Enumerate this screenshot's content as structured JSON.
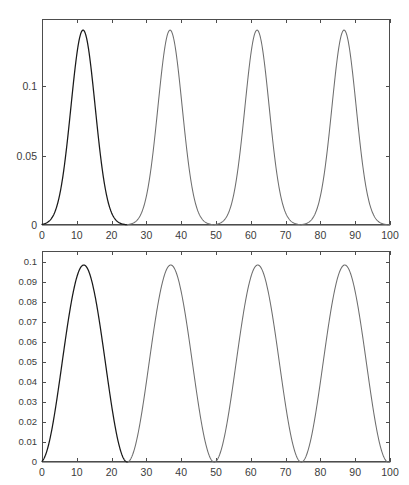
{
  "figure": {
    "background_color": "#ffffff",
    "axis_color": "#4d4d4d",
    "primary_curve_color": "#1a1a1a",
    "secondary_curve_color": "#6e6e6e",
    "panel_count": 2
  },
  "chart_data": [
    {
      "type": "line",
      "panel": "top",
      "title": "",
      "xlabel": "",
      "ylabel": "",
      "xlim": [
        0,
        100
      ],
      "ylim": [
        0,
        0.1485
      ],
      "grid": false,
      "legend": null,
      "xticks": [
        0,
        10,
        20,
        30,
        40,
        50,
        60,
        70,
        80,
        90,
        100
      ],
      "xtick_labels": [
        "0",
        "10",
        "20",
        "30",
        "40",
        "50",
        "60",
        "70",
        "80",
        "90",
        "100"
      ],
      "yticks": [
        0,
        0.05,
        0.1
      ],
      "ytick_labels": [
        "0",
        "0.05",
        "0.1"
      ],
      "description": "Four narrow Gaussian-like pulses of equal height, periodic with period 25, peaks reaching about 0.1405 and decaying to zero between pulses. First pulse drawn in black, remaining three in gray.",
      "series": [
        {
          "name": "pulse-1",
          "style": "primary",
          "peak_x": 11.8,
          "peak_y": 0.1405,
          "half_width": 4.1,
          "x_start": 0,
          "x_end": 24.5
        },
        {
          "name": "pulse-2",
          "style": "secondary",
          "peak_x": 36.8,
          "peak_y": 0.1405,
          "half_width": 4.1,
          "x_start": 24.5,
          "x_end": 49.5
        },
        {
          "name": "pulse-3",
          "style": "secondary",
          "peak_x": 61.8,
          "peak_y": 0.1405,
          "half_width": 4.1,
          "x_start": 49.5,
          "x_end": 74.5
        },
        {
          "name": "pulse-4",
          "style": "secondary",
          "peak_x": 86.8,
          "peak_y": 0.1405,
          "half_width": 4.1,
          "x_start": 74.5,
          "x_end": 100
        }
      ],
      "sampled_points": {
        "x": [
          0,
          2,
          4,
          6,
          8,
          10,
          11.8,
          14,
          16,
          18,
          20,
          22,
          25,
          30,
          33,
          35,
          36.8,
          39,
          41,
          43,
          45,
          50,
          55,
          58,
          60,
          61.8,
          64,
          66,
          68,
          70,
          75,
          80,
          83,
          85,
          86.8,
          89,
          91,
          93,
          95,
          100
        ],
        "y": [
          0.0,
          0.0007,
          0.006,
          0.027,
          0.079,
          0.131,
          0.1405,
          0.125,
          0.071,
          0.023,
          0.005,
          0.0006,
          0.0,
          0.0007,
          0.027,
          0.098,
          0.1405,
          0.118,
          0.061,
          0.017,
          0.003,
          0.0,
          0.0007,
          0.027,
          0.098,
          0.1405,
          0.118,
          0.061,
          0.017,
          0.003,
          0.0,
          0.0007,
          0.027,
          0.098,
          0.1405,
          0.118,
          0.061,
          0.017,
          0.003,
          0.0
        ]
      }
    },
    {
      "type": "line",
      "panel": "bottom",
      "title": "",
      "xlabel": "",
      "ylabel": "",
      "xlim": [
        0,
        100
      ],
      "ylim": [
        0,
        0.1055
      ],
      "grid": false,
      "legend": null,
      "xticks": [
        0,
        10,
        20,
        30,
        40,
        50,
        60,
        70,
        80,
        90,
        100
      ],
      "xtick_labels": [
        "0",
        "10",
        "20",
        "30",
        "40",
        "50",
        "60",
        "70",
        "80",
        "90",
        "100"
      ],
      "yticks": [
        0,
        0.01,
        0.02,
        0.03,
        0.04,
        0.05,
        0.06,
        0.07,
        0.08,
        0.09,
        0.1
      ],
      "ytick_labels": [
        "0",
        "0.01",
        "0.02",
        "0.03",
        "0.04",
        "0.05",
        "0.06",
        "0.07",
        "0.08",
        "0.09",
        "0.1"
      ],
      "description": "Four broad raised-cosine style humps of equal height, periodic with period 25, peaks reaching about 0.0985 and dipping back to zero at the minima near x = 24.5, 49.5 and 74.5. First hump drawn in black, remaining three in gray.",
      "series": [
        {
          "name": "hump-1",
          "style": "primary",
          "peak_x": 12.0,
          "peak_y": 0.0985,
          "x_start": 0,
          "x_end": 24.6
        },
        {
          "name": "hump-2",
          "style": "secondary",
          "peak_x": 37.0,
          "peak_y": 0.0985,
          "x_start": 24.6,
          "x_end": 49.6
        },
        {
          "name": "hump-3",
          "style": "secondary",
          "peak_x": 62.0,
          "peak_y": 0.0985,
          "x_start": 49.6,
          "x_end": 74.6
        },
        {
          "name": "hump-4",
          "style": "secondary",
          "peak_x": 87.0,
          "peak_y": 0.0985,
          "x_start": 74.6,
          "x_end": 100
        }
      ],
      "sampled_points": {
        "x": [
          0,
          2,
          4,
          6,
          8,
          10,
          12,
          14,
          16,
          18,
          20,
          22,
          24.6,
          27,
          29,
          31,
          33,
          35,
          37,
          39,
          41,
          43,
          45,
          47,
          49.6,
          52,
          54,
          56,
          58,
          60,
          62,
          64,
          66,
          68,
          70,
          72,
          74.6,
          77,
          79,
          81,
          83,
          85,
          87,
          89,
          91,
          93,
          95,
          97,
          100
        ],
        "y": [
          0.002,
          0.006,
          0.016,
          0.033,
          0.056,
          0.081,
          0.0985,
          0.097,
          0.08,
          0.055,
          0.031,
          0.011,
          0.0,
          0.005,
          0.016,
          0.033,
          0.056,
          0.081,
          0.0985,
          0.097,
          0.08,
          0.055,
          0.031,
          0.011,
          0.0,
          0.005,
          0.016,
          0.033,
          0.056,
          0.081,
          0.0985,
          0.097,
          0.08,
          0.055,
          0.031,
          0.011,
          0.0,
          0.005,
          0.016,
          0.033,
          0.056,
          0.081,
          0.0985,
          0.097,
          0.08,
          0.055,
          0.031,
          0.011,
          0.0
        ]
      }
    }
  ]
}
